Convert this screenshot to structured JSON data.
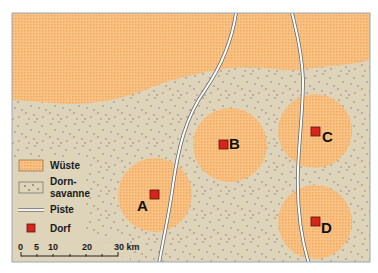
{
  "colors": {
    "desert": "#f8c384",
    "desert_dot": "#ee9f55",
    "savanna": "#ddd4ba",
    "savanna_dot": "#b9a39d",
    "road": "#ffffff",
    "road_edge": "#5a5a5a",
    "village": "#d9241b",
    "village_border": "#5a1410",
    "frame": "#9aa8b3"
  },
  "legend": {
    "items": [
      {
        "key": "desert",
        "label": "Wüste"
      },
      {
        "key": "savanna",
        "label_line1": "Dorn-",
        "label_line2": "savanne"
      },
      {
        "key": "road",
        "label": "Piste"
      },
      {
        "key": "village",
        "label": "Dorf"
      }
    ]
  },
  "scale_bar": {
    "ticks": [
      "0",
      "5",
      "10",
      "20",
      "30 km"
    ],
    "unit": "km",
    "max": 30
  },
  "villages": [
    {
      "id": "A",
      "label": "A"
    },
    {
      "id": "B",
      "label": "B"
    },
    {
      "id": "C",
      "label": "C"
    },
    {
      "id": "D",
      "label": "D"
    }
  ]
}
